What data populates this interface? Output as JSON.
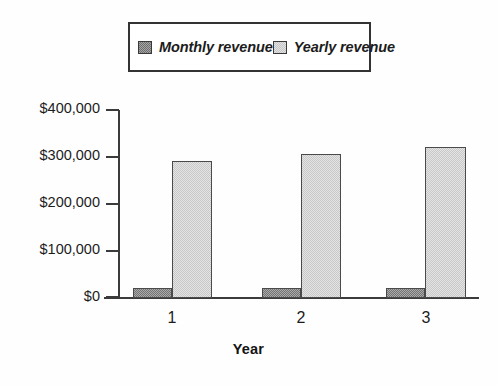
{
  "chart_data": {
    "type": "bar",
    "title": "",
    "subtitle": "",
    "xlabel": "Year",
    "ylabel": "",
    "categories": [
      "1",
      "2",
      "3"
    ],
    "series": [
      {
        "name": "Monthly revenue",
        "values": [
          22000,
          22000,
          22000
        ],
        "color": "#8f8f8f",
        "swatch": "monthly-swatch"
      },
      {
        "name": "Yearly revenue",
        "values": [
          290000,
          305000,
          320000
        ],
        "color": "#d4d4d4",
        "swatch": "yearly-swatch"
      }
    ],
    "ylim": [
      0,
      400000
    ],
    "yticks": [
      0,
      100000,
      200000,
      300000,
      400000
    ],
    "ytick_labels": [
      "$0",
      "$100,000",
      "$200,000",
      "$300,000",
      "$400,000"
    ],
    "grid": false,
    "legend_position": "top",
    "legend_entries": [
      "Monthly revenue",
      "Yearly revenue"
    ]
  },
  "legend": {
    "entries": [
      {
        "label": "Monthly revenue"
      },
      {
        "label": "Yearly revenue"
      }
    ]
  },
  "axes": {
    "y_tick_labels": [
      "$400,000",
      "$300,000",
      "$200,000",
      "$100,000",
      "$0"
    ],
    "x_tick_labels": [
      "1",
      "2",
      "3"
    ],
    "x_title": "Year"
  }
}
